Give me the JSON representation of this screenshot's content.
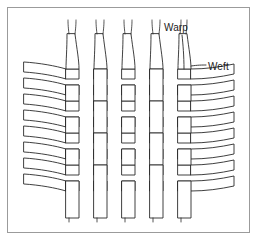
{
  "figure": {
    "kind": "weave-diagram",
    "title_label_warp": "Warp",
    "title_label_weft": "Weft",
    "colors": {
      "background": "#ffffff",
      "frame_border": "#9b9b9b",
      "thread_stroke": "#2a2a2a",
      "thread_fill": "#ffffff",
      "label_text": "#1a1a1a"
    },
    "frame": {
      "x": 7,
      "y": 7,
      "width": 243,
      "height": 226,
      "stroke_width": 1
    },
    "weave": {
      "pattern": "plain-weave-over-under",
      "warp_count": 5,
      "weft_count": 9,
      "warp_label_anchor_x": 178,
      "weft_label_anchor_x": 204,
      "warp_columns_x": [
        72,
        100,
        128,
        156,
        184
      ],
      "warp_width": 13,
      "weft_rows_y": [
        72,
        86,
        100,
        114,
        128,
        142,
        156,
        170,
        184
      ],
      "weft_height": 10,
      "warp_top_y": 34,
      "warp_bottom_y": 218,
      "weft_left_x": 24,
      "weft_right_x": 234
    }
  },
  "labels": {
    "warp": "Warp",
    "weft": "Weft"
  }
}
